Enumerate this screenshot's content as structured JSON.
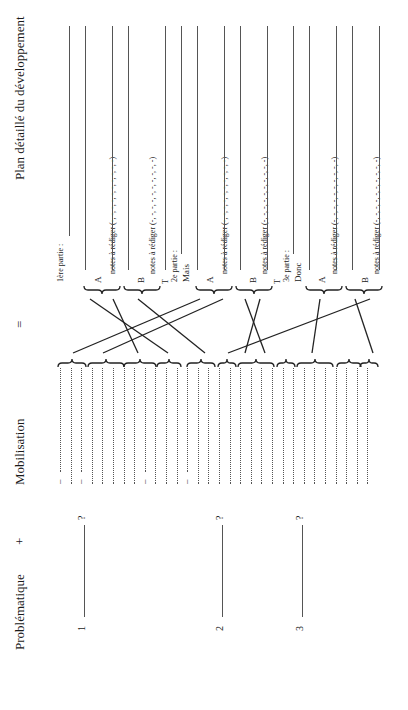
{
  "headers": {
    "problematique": "Problématique",
    "plus": "+",
    "mobilisation": "Mobilisation",
    "equals": "=",
    "plan": "Plan détaillé du développement"
  },
  "problematique": {
    "items": [
      {
        "number": "1",
        "suffix": "?"
      },
      {
        "number": "2",
        "suffix": "?"
      },
      {
        "number": "3",
        "suffix": "?"
      }
    ]
  },
  "mobilisation": {
    "dash": "–",
    "line_count": 30
  },
  "plan": {
    "parts": [
      {
        "title": "1ère partie :",
        "connector": "",
        "sections": [
          {
            "letter": "A",
            "notes": "notes à rédiger (-, -, -, -, -, -, -, -, -, -)"
          },
          {
            "letter": "B",
            "notes": "notes à rédiger (-, -, -, -, -, -, -, -, -, -)"
          }
        ],
        "transition": "T"
      },
      {
        "title": "2e partie :",
        "connector": "Mais",
        "sections": [
          {
            "letter": "A",
            "notes": "notes à rédiger (-, -, -, -, -, -, -, -, -, -)"
          },
          {
            "letter": "B",
            "notes": "notes à rédiger (-, -, -, -, -, -, -, -, -, -)"
          }
        ],
        "transition": "T"
      },
      {
        "title": "3e partie :",
        "connector": "Donc",
        "sections": [
          {
            "letter": "A",
            "notes": "notes à rédiger (-, -, -, -, -, -, -, -, -, -)"
          },
          {
            "letter": "B",
            "notes": "notes à rédiger (-, -, -, -, -, -, -, -, -, -)"
          }
        ],
        "transition": ""
      }
    ]
  }
}
